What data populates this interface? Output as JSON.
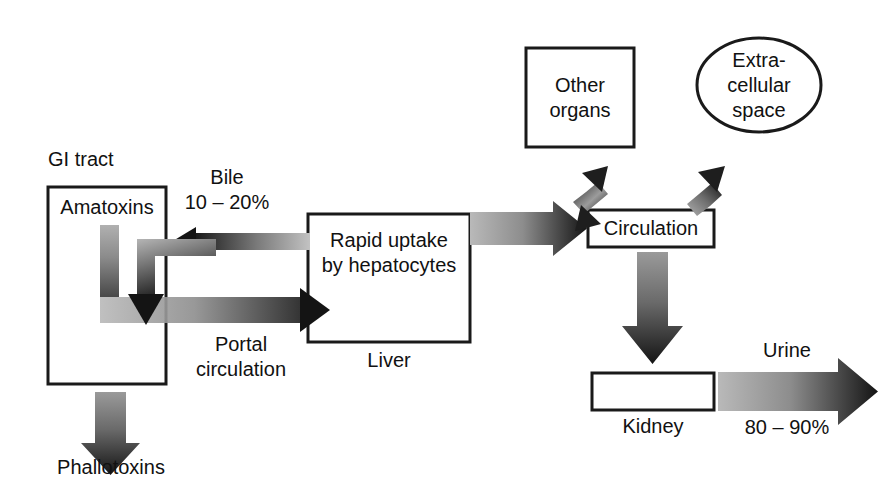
{
  "diagram": {
    "background": "#ffffff",
    "stroke": "#1a1a1a",
    "arrow_dark": "#1a1a1a",
    "arrow_light": "#b4b4b4"
  },
  "nodes": {
    "gi_tract_label": "GI tract",
    "amatoxins": "Amatoxins",
    "liver_line1": "Rapid uptake",
    "liver_line2": "by hepatocytes",
    "liver_label": "Liver",
    "circulation": "Circulation",
    "other_organs_line1": "Other",
    "other_organs_line2": "organs",
    "extracellular_line1": "Extra-",
    "extracellular_line2": "cellular",
    "extracellular_line3": "space",
    "kidney_label": "Kidney",
    "phallotoxins": "Phallotoxins"
  },
  "edge_labels": {
    "bile": "Bile",
    "bile_pct": "10 – 20%",
    "portal_line1": "Portal",
    "portal_line2": "circulation",
    "urine": "Urine",
    "urine_pct": "80 – 90%"
  }
}
